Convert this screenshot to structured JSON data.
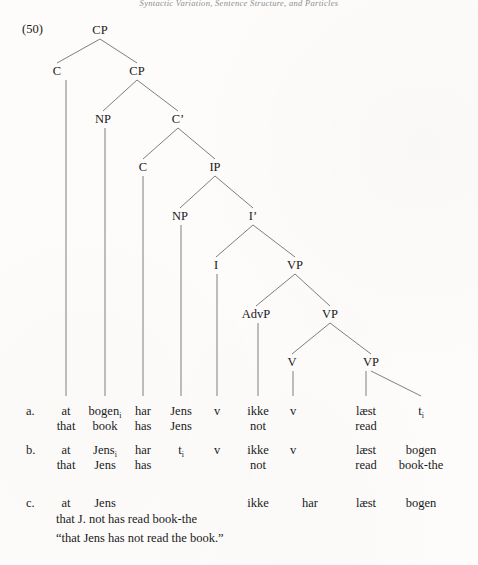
{
  "running_head": "Syntactic Variation, Sentence Structure, and Particles",
  "example_number": "(50)",
  "tree": {
    "nodes": [
      {
        "id": "CP1",
        "label": "CP",
        "x": 100,
        "y": 33
      },
      {
        "id": "C1",
        "label": "C",
        "x": 57,
        "y": 74
      },
      {
        "id": "CP2",
        "label": "CP",
        "x": 137,
        "y": 74
      },
      {
        "id": "NP1",
        "label": "NP",
        "x": 103,
        "y": 122
      },
      {
        "id": "Cbar",
        "label": "C’",
        "x": 178,
        "y": 122
      },
      {
        "id": "C2",
        "label": "C",
        "x": 143,
        "y": 170
      },
      {
        "id": "IP",
        "label": "IP",
        "x": 215,
        "y": 170
      },
      {
        "id": "NP2",
        "label": "NP",
        "x": 180,
        "y": 219
      },
      {
        "id": "Ibar",
        "label": "I’",
        "x": 253,
        "y": 219
      },
      {
        "id": "I",
        "label": "I",
        "x": 216,
        "y": 268
      },
      {
        "id": "VP1",
        "label": "VP",
        "x": 295,
        "y": 268
      },
      {
        "id": "AdvP",
        "label": "AdvP",
        "x": 256,
        "y": 317
      },
      {
        "id": "VP2",
        "label": "VP",
        "x": 330,
        "y": 317
      },
      {
        "id": "V",
        "label": "V",
        "x": 292,
        "y": 365
      },
      {
        "id": "VP3",
        "label": "VP",
        "x": 371,
        "y": 365
      }
    ],
    "edges": [
      [
        "CP1",
        "C1"
      ],
      [
        "CP1",
        "CP2"
      ],
      [
        "CP2",
        "NP1"
      ],
      [
        "CP2",
        "Cbar"
      ],
      [
        "Cbar",
        "C2"
      ],
      [
        "Cbar",
        "IP"
      ],
      [
        "IP",
        "NP2"
      ],
      [
        "IP",
        "Ibar"
      ],
      [
        "Ibar",
        "I"
      ],
      [
        "Ibar",
        "VP1"
      ],
      [
        "VP1",
        "AdvP"
      ],
      [
        "VP1",
        "VP2"
      ],
      [
        "VP2",
        "V"
      ],
      [
        "VP2",
        "VP3"
      ]
    ],
    "leaf_lines": [
      {
        "from": "C1",
        "x": 66,
        "y1": 80,
        "y2": 396
      },
      {
        "from": "NP1",
        "x": 105,
        "y1": 128,
        "y2": 396
      },
      {
        "from": "C2",
        "x": 143,
        "y1": 176,
        "y2": 396
      },
      {
        "from": "NP2",
        "x": 181,
        "y1": 225,
        "y2": 396
      },
      {
        "from": "I",
        "x": 217,
        "y1": 274,
        "y2": 396
      },
      {
        "from": "AdvP",
        "x": 258,
        "y1": 323,
        "y2": 396
      },
      {
        "from": "V",
        "x": 293,
        "y1": 371,
        "y2": 396
      },
      {
        "from": "VP3",
        "x": 366,
        "y1": 371,
        "y2": 396
      }
    ],
    "trace_edge": {
      "x1": 371,
      "y1": 371,
      "x2": 421,
      "y2": 396
    }
  },
  "rows": [
    {
      "letter": "a.",
      "letter_x": 26,
      "line1_y": 404,
      "line2_y": 419,
      "tokens": [
        {
          "x": 66,
          "form": "at",
          "gloss": "that",
          "sub": ""
        },
        {
          "x": 105,
          "form": "bogen",
          "gloss": "book",
          "sub": "i"
        },
        {
          "x": 143,
          "form": "har",
          "gloss": "has",
          "sub": ""
        },
        {
          "x": 181,
          "form": "Jens",
          "gloss": "Jens",
          "sub": ""
        },
        {
          "x": 217,
          "form": "v",
          "gloss": "",
          "sub": ""
        },
        {
          "x": 258,
          "form": "ikke",
          "gloss": "not",
          "sub": ""
        },
        {
          "x": 293,
          "form": "v",
          "gloss": "",
          "sub": ""
        },
        {
          "x": 366,
          "form": "læst",
          "gloss": "read",
          "sub": ""
        },
        {
          "x": 421,
          "form": "t",
          "gloss": "",
          "sub": "i"
        }
      ]
    },
    {
      "letter": "b.",
      "letter_x": 26,
      "line1_y": 443,
      "line2_y": 458,
      "tokens": [
        {
          "x": 66,
          "form": "at",
          "gloss": "that",
          "sub": ""
        },
        {
          "x": 105,
          "form": "Jens",
          "gloss": "Jens",
          "sub": "i"
        },
        {
          "x": 143,
          "form": "har",
          "gloss": "has",
          "sub": ""
        },
        {
          "x": 181,
          "form": "t",
          "gloss": "",
          "sub": "i"
        },
        {
          "x": 217,
          "form": "v",
          "gloss": "",
          "sub": ""
        },
        {
          "x": 258,
          "form": "ikke",
          "gloss": "not",
          "sub": ""
        },
        {
          "x": 293,
          "form": "v",
          "gloss": "",
          "sub": ""
        },
        {
          "x": 366,
          "form": "læst",
          "gloss": "read",
          "sub": ""
        },
        {
          "x": 421,
          "form": "bogen",
          "gloss": "book-the",
          "sub": ""
        }
      ]
    },
    {
      "letter": "c.",
      "letter_x": 26,
      "line1_y": 496,
      "line2_y": 512,
      "tokens": [
        {
          "x": 66,
          "form": "at",
          "gloss": "",
          "sub": ""
        },
        {
          "x": 105,
          "form": "Jens",
          "gloss": "",
          "sub": ""
        },
        {
          "x": 258,
          "form": "ikke",
          "gloss": "",
          "sub": ""
        },
        {
          "x": 310,
          "form": "har",
          "gloss": "",
          "sub": ""
        },
        {
          "x": 366,
          "form": "læst",
          "gloss": "",
          "sub": ""
        },
        {
          "x": 421,
          "form": "bogen",
          "gloss": "",
          "sub": ""
        }
      ],
      "gloss_line": "that J. not has read book-the"
    }
  ],
  "translation": "“that Jens has not read the book.”",
  "colors": {
    "ink": "#1a1a1a",
    "line": "#6f6f6f",
    "page": "#fdfcfb"
  }
}
